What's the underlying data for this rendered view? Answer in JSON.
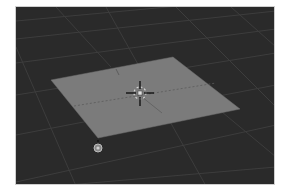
{
  "app": "3D viewport",
  "viewport": {
    "background_color": "#2a2a2a",
    "grid_color": "#3c3c3c",
    "border_color": "#cfcfcf"
  },
  "scene": {
    "plane": {
      "name": "plane-mesh",
      "fill_color": "#7b7b7b",
      "corners": [
        [
          35,
          73
        ],
        [
          157,
          50
        ],
        [
          224,
          102
        ],
        [
          82,
          131
        ]
      ]
    },
    "cursor_3d": {
      "center": [
        124,
        86
      ],
      "crosshair_color": "#000000",
      "ring_color": "#d8d8d8"
    },
    "object_origin": {
      "center": [
        124,
        86
      ],
      "color": "#e0e0e0"
    },
    "lamp": {
      "center": [
        82,
        141
      ],
      "color": "#bdbdbd"
    }
  }
}
